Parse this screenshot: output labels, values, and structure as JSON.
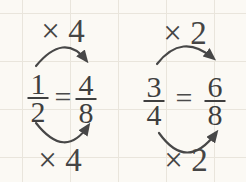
{
  "colors": {
    "background": "#fbf9f4",
    "grid": "#e9e5dc",
    "ink": "#3f3f3f",
    "arrow": "#474747"
  },
  "examples": [
    {
      "top_label": "× 4",
      "bottom_label": "× 4",
      "left_fraction": {
        "numerator": "1",
        "denominator": "2"
      },
      "equals": "=",
      "right_fraction": {
        "numerator": "4",
        "denominator": "8"
      }
    },
    {
      "top_label": "× 2",
      "bottom_label": "× 2",
      "left_fraction": {
        "numerator": "3",
        "denominator": "4"
      },
      "equals": "=",
      "right_fraction": {
        "numerator": "6",
        "denominator": "8"
      }
    }
  ]
}
